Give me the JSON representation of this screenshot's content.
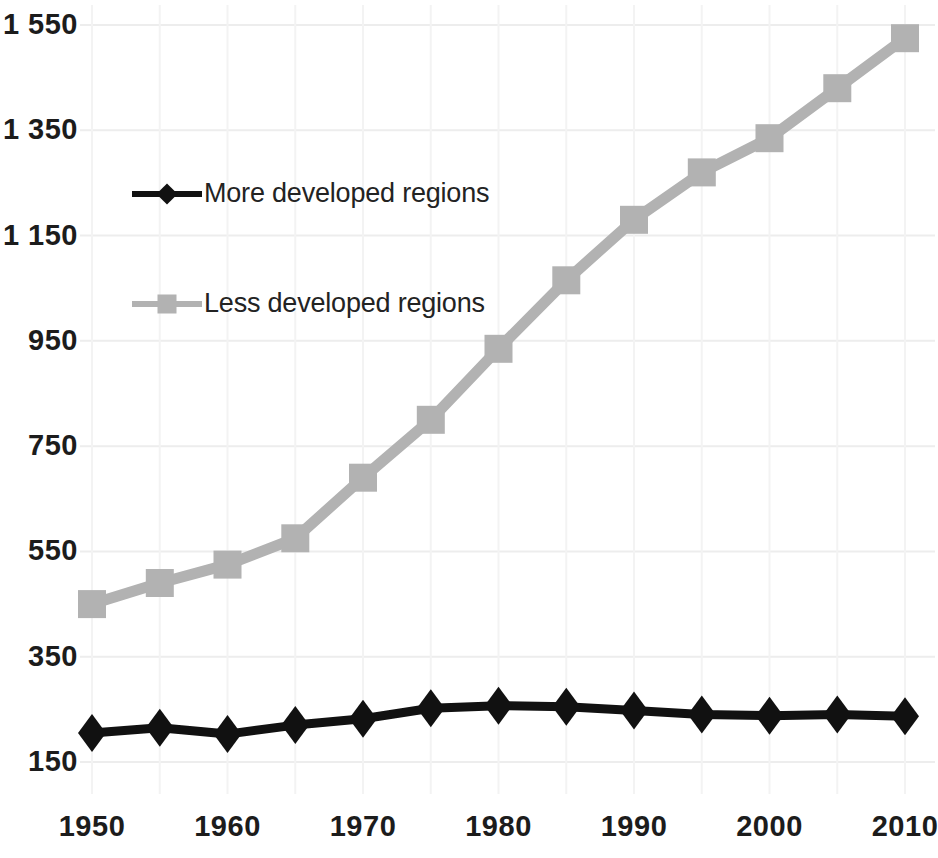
{
  "chart_data": {
    "type": "line",
    "title": "",
    "subtitle": "",
    "xlabel": "",
    "ylabel": "",
    "x": [
      1950,
      1955,
      1960,
      1965,
      1970,
      1975,
      1980,
      1985,
      1990,
      1995,
      2000,
      2005,
      2010
    ],
    "xtick_labels": [
      "1950",
      "1960",
      "1970",
      "1980",
      "1990",
      "2000",
      "2010"
    ],
    "xtick_values": [
      1950,
      1960,
      1970,
      1980,
      1990,
      2000,
      2010
    ],
    "xlim": [
      1950,
      2010
    ],
    "ytick_labels": [
      "150",
      "350",
      "550",
      "750",
      "950",
      "1 150",
      "1 350",
      "1 550"
    ],
    "ytick_values": [
      150,
      350,
      550,
      750,
      950,
      1150,
      1350,
      1550
    ],
    "ylim": [
      150,
      1550
    ],
    "grid": "horizontal-and-vertical-faint",
    "legend_position": "upper-left-inside",
    "series": [
      {
        "name": "More developed regions",
        "color": "#111111",
        "marker": "diamond",
        "values": [
          205,
          215,
          203,
          220,
          232,
          252,
          257,
          255,
          248,
          240,
          238,
          240,
          237
        ]
      },
      {
        "name": "Less developed regions",
        "color": "#b2b2b2",
        "marker": "square",
        "values": [
          450,
          490,
          525,
          575,
          690,
          800,
          935,
          1065,
          1180,
          1270,
          1335,
          1430,
          1525
        ]
      }
    ]
  },
  "legend": {
    "items": [
      {
        "label": "More developed regions",
        "color": "#111111",
        "marker": "diamond"
      },
      {
        "label": "Less developed regions",
        "color": "#b2b2b2",
        "marker": "square"
      }
    ]
  },
  "colors": {
    "more_developed": "#111111",
    "less_developed": "#b2b2b2",
    "grid": "#ededed",
    "text": "#1c1c1c",
    "background": "#ffffff"
  }
}
